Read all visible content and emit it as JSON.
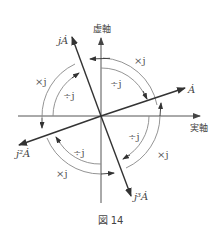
{
  "diagram": {
    "axes": {
      "real_label": "実軸",
      "imag_label": "虚軸"
    },
    "vectors": [
      {
        "name": "A",
        "label": "Ȧ"
      },
      {
        "name": "jA",
        "label": "jȦ"
      },
      {
        "name": "j2A",
        "label": "j²Ȧ"
      },
      {
        "name": "j3A",
        "label": "j³Ȧ"
      }
    ],
    "operations": {
      "multiply": "×j",
      "divide": "÷j"
    },
    "op_labels": [
      {
        "quadrant": "upper-right",
        "outer": "×j",
        "inner": "÷j"
      },
      {
        "quadrant": "upper-left",
        "outer": "×j",
        "inner": "÷j"
      },
      {
        "quadrant": "lower-left",
        "outer": "×j",
        "inner": "÷j"
      },
      {
        "quadrant": "lower-right",
        "outer": "×j",
        "inner": "÷j"
      }
    ],
    "colors": {
      "vector": "#333333",
      "axis": "#555555",
      "arc": "#888888"
    }
  },
  "caption": "図 14"
}
